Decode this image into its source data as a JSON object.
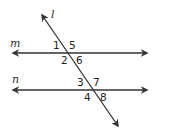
{
  "diagram": {
    "lines": {
      "m": {
        "label": "m"
      },
      "n": {
        "label": "n"
      },
      "l": {
        "label": "l"
      }
    },
    "angles": {
      "a1": "1",
      "a2": "2",
      "a5": "5",
      "a6": "6",
      "a3": "3",
      "a4": "4",
      "a7": "7",
      "a8": "8"
    },
    "colors": {
      "stroke": "#333333",
      "background": "#ffffff"
    }
  }
}
